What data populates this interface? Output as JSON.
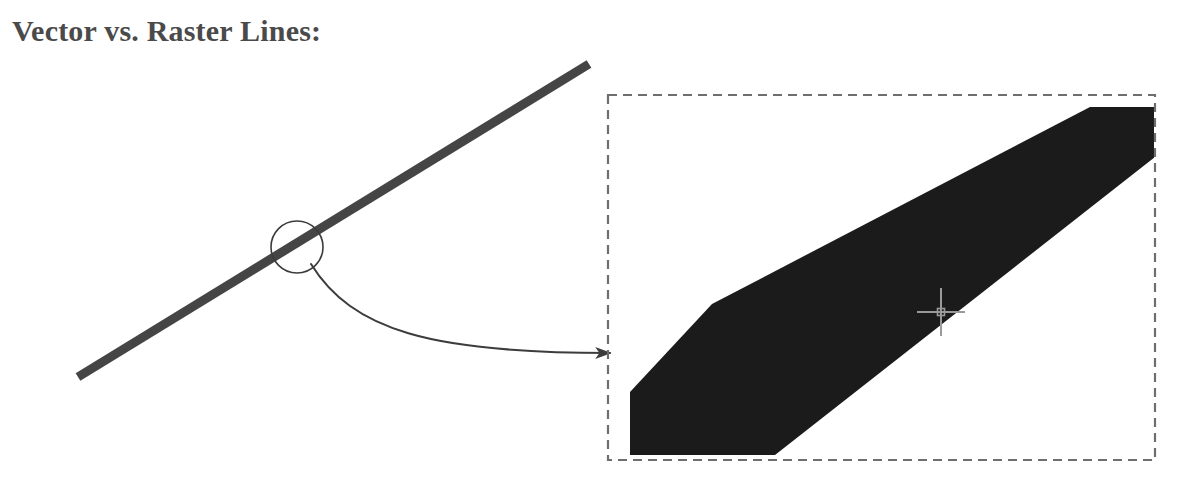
{
  "figure": {
    "title": "Vector vs. Raster Lines:",
    "title_color": "#4a4a4a",
    "background_color": "#ffffff",
    "width": 1189,
    "height": 487
  },
  "vector_side": {
    "label": "vector-line",
    "line_color": "#454545",
    "line_thickness_px": 9,
    "start_point": {
      "x": 78,
      "y": 377
    },
    "end_point": {
      "x": 589,
      "y": 64
    },
    "magnifier_circle": {
      "center_x": 297,
      "center_y": 247,
      "radius": 26,
      "stroke_color": "#3c3c3c",
      "stroke_width": 1.6
    },
    "callout_arrow": {
      "color": "#3c3c3c",
      "stroke_width": 2,
      "start": {
        "x": 311,
        "y": 264
      },
      "control_1": {
        "x": 352,
        "y": 330
      },
      "control_2": {
        "x": 430,
        "y": 353
      },
      "end": {
        "x": 612,
        "y": 353
      },
      "arrowhead": "solid-triangle"
    }
  },
  "raster_side": {
    "label": "raster-zoom-box",
    "dashed_box": {
      "x": 608,
      "y": 95,
      "width": 547,
      "height": 365,
      "stroke_color": "#6e6e6e",
      "stroke_width": 2.2,
      "dash": "9 6"
    },
    "raster_band": {
      "fill_color": "#1b1b1b",
      "description": "pixelated zoomed raster line band with flat cut ends",
      "points": "630,392 712,304 1090,107 1155,107 1155,157 775,455 630,455"
    },
    "crosshair_cursor": {
      "center_x": 941,
      "center_y": 312,
      "arm_length": 24,
      "color": "#9a9a9a",
      "stroke_width": 2,
      "center_square_size": 7
    }
  }
}
